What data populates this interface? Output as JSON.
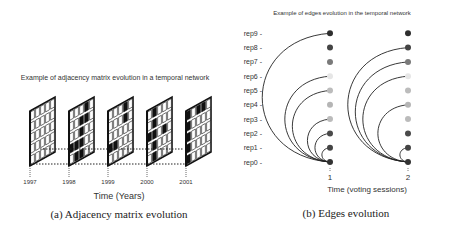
{
  "panel_a": {
    "title": "Example of adjacency matrix evolution in a temporal network",
    "xlabel": "Time (Years)",
    "caption": "(a) Adjacency matrix evolution",
    "years": [
      "1997",
      "1998",
      "1999",
      "2000",
      "2001"
    ],
    "matrices": [
      {
        "year": "1997",
        "filled": []
      },
      {
        "year": "1998",
        "filled": [
          [
            0,
            3
          ],
          [
            1,
            3
          ],
          [
            1,
            2
          ],
          [
            2,
            2
          ],
          [
            3,
            0
          ],
          [
            3,
            1
          ],
          [
            3,
            2
          ],
          [
            4,
            1
          ],
          [
            4,
            2
          ]
        ]
      },
      {
        "year": "1999",
        "filled": [
          [
            0,
            3
          ],
          [
            1,
            3
          ],
          [
            3,
            0
          ],
          [
            3,
            1
          ]
        ]
      },
      {
        "year": "2000",
        "filled": [
          [
            0,
            1
          ],
          [
            1,
            1
          ],
          [
            2,
            0
          ],
          [
            2,
            1
          ],
          [
            2,
            3
          ],
          [
            3,
            1
          ],
          [
            4,
            1
          ]
        ]
      },
      {
        "year": "2001",
        "filled": [
          [
            0,
            0
          ],
          [
            0,
            2
          ],
          [
            0,
            3
          ],
          [
            1,
            0
          ],
          [
            2,
            0
          ],
          [
            3,
            0
          ],
          [
            4,
            0
          ]
        ]
      }
    ]
  },
  "panel_b": {
    "title": "Example of edges evolution in the temporal network",
    "xlabel": "Time (voting sessions)",
    "caption": "(b) Edges evolution",
    "ticks": [
      "1",
      "2"
    ],
    "nodes": [
      "rep0",
      "rep1",
      "rep2",
      "rep3",
      "rep4",
      "rep5",
      "rep6",
      "rep7",
      "rep8",
      "rep9"
    ],
    "node_colors": [
      "#333333",
      "#444444",
      "#4a4a4a",
      "#bbbbbb",
      "#b5b5b5",
      "#bcbcbc",
      "#e6e6e6",
      "#7a7a7a",
      "#444444",
      "#2e2e2e"
    ],
    "session_edges": [
      {
        "session": "1",
        "from": "rep0",
        "to": [
          "rep9",
          "rep6",
          "rep5",
          "rep3",
          "rep2",
          "rep1"
        ]
      },
      {
        "session": "2",
        "from": "rep0",
        "to": [
          "rep8",
          "rep7",
          "rep6",
          "rep4",
          "rep1"
        ]
      }
    ]
  },
  "colors": {
    "ink": "#111111",
    "edge": "#222222",
    "text": "#333333"
  }
}
